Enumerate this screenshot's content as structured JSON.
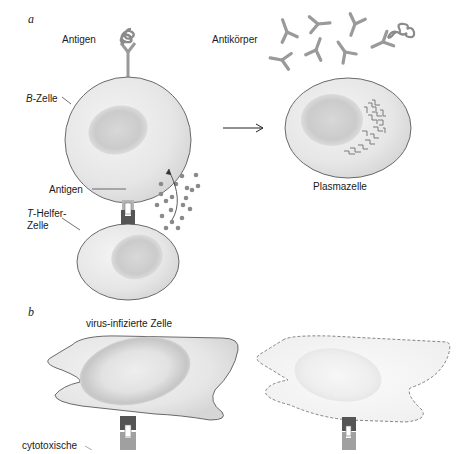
{
  "panels": {
    "a": {
      "letter": "a",
      "labels": {
        "antigen_top": "Antigen",
        "antibodies": "Antikörper",
        "b_cell_prefix": "B",
        "b_cell_suffix": "-Zelle",
        "antigen_mid": "Antigen",
        "t_helper_prefix": "T",
        "t_helper_suffix": "-Helfer-",
        "t_helper_line2": "Zelle",
        "plasma_cell": "Plasmazelle"
      }
    },
    "b": {
      "letter": "b",
      "labels": {
        "infected_cell": "virus-infizierte Zelle",
        "cytotoxic": "cytotoxische"
      }
    }
  },
  "colors": {
    "cell_fill": "#e9e9e9",
    "cell_outline": "#5a5a5a",
    "nucleus": "#cfcfcf",
    "antibody": "#9a9a9a",
    "receptor_dark": "#555555",
    "receptor_light": "#a0a0a0",
    "cytokine_dots": "#8a8a8a"
  }
}
